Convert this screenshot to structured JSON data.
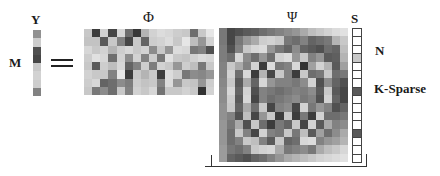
{
  "labels": {
    "y": "Y",
    "m": "M",
    "equals": "=",
    "phi": "Φ",
    "psi": "Ψ",
    "s": "S",
    "n": "N",
    "k_sparse": "K-Sparse"
  },
  "y_vector": [
    145,
    205,
    80,
    70,
    200,
    210,
    205,
    130
  ],
  "phi_matrix": {
    "rows": 8,
    "cols": 16,
    "values": [
      [
        200,
        60,
        210,
        70,
        215,
        110,
        55,
        180,
        210,
        220,
        215,
        205,
        200,
        110,
        200,
        230
      ],
      [
        195,
        195,
        90,
        200,
        130,
        70,
        200,
        100,
        205,
        210,
        220,
        200,
        230,
        190,
        150,
        210
      ],
      [
        215,
        200,
        210,
        180,
        205,
        215,
        200,
        210,
        140,
        200,
        150,
        220,
        215,
        120,
        130,
        80
      ],
      [
        205,
        225,
        215,
        110,
        210,
        140,
        210,
        130,
        205,
        120,
        225,
        200,
        195,
        210,
        220,
        215
      ],
      [
        200,
        90,
        205,
        190,
        215,
        100,
        130,
        205,
        125,
        210,
        200,
        150,
        205,
        190,
        120,
        200
      ],
      [
        210,
        200,
        200,
        130,
        230,
        60,
        200,
        180,
        200,
        60,
        220,
        205,
        120,
        140,
        135,
        150
      ],
      [
        205,
        215,
        100,
        110,
        140,
        125,
        205,
        195,
        200,
        130,
        220,
        150,
        200,
        195,
        150,
        205
      ],
      [
        200,
        120,
        140,
        110,
        200,
        130,
        210,
        200,
        215,
        115,
        200,
        200,
        210,
        200,
        50,
        210
      ]
    ]
  },
  "psi_matrix": {
    "rows": 16,
    "cols": 16,
    "values": [
      [
        120,
        70,
        80,
        90,
        95,
        110,
        120,
        130,
        140,
        150,
        170,
        190,
        200,
        210,
        220,
        225
      ],
      [
        120,
        70,
        120,
        150,
        170,
        205,
        210,
        200,
        120,
        110,
        130,
        100,
        110,
        120,
        180,
        200
      ],
      [
        125,
        80,
        130,
        200,
        215,
        220,
        150,
        120,
        100,
        140,
        100,
        90,
        80,
        110,
        100,
        190
      ],
      [
        125,
        110,
        215,
        140,
        110,
        150,
        110,
        210,
        220,
        150,
        200,
        130,
        150,
        90,
        95,
        180
      ],
      [
        130,
        200,
        170,
        130,
        210,
        60,
        220,
        120,
        130,
        215,
        50,
        160,
        210,
        180,
        90,
        160
      ],
      [
        130,
        210,
        110,
        215,
        60,
        180,
        70,
        200,
        130,
        60,
        200,
        110,
        120,
        200,
        110,
        120
      ],
      [
        135,
        200,
        90,
        170,
        100,
        215,
        150,
        130,
        130,
        120,
        140,
        210,
        80,
        140,
        100,
        80
      ],
      [
        140,
        215,
        100,
        210,
        80,
        130,
        120,
        110,
        120,
        130,
        125,
        140,
        90,
        200,
        90,
        70
      ],
      [
        140,
        205,
        90,
        215,
        70,
        130,
        110,
        120,
        130,
        140,
        120,
        130,
        80,
        210,
        100,
        70
      ],
      [
        145,
        200,
        100,
        170,
        110,
        200,
        70,
        130,
        140,
        70,
        210,
        120,
        150,
        130,
        80,
        100
      ],
      [
        145,
        130,
        80,
        190,
        70,
        150,
        200,
        60,
        200,
        60,
        120,
        60,
        210,
        110,
        110,
        120
      ],
      [
        150,
        120,
        170,
        80,
        200,
        110,
        60,
        120,
        100,
        200,
        70,
        210,
        90,
        170,
        130,
        140
      ],
      [
        150,
        110,
        200,
        130,
        70,
        210,
        130,
        120,
        200,
        120,
        190,
        90,
        160,
        110,
        140,
        170
      ],
      [
        150,
        110,
        130,
        200,
        190,
        130,
        90,
        200,
        100,
        110,
        215,
        220,
        130,
        150,
        160,
        180
      ],
      [
        155,
        120,
        110,
        130,
        200,
        210,
        215,
        170,
        120,
        130,
        140,
        120,
        170,
        190,
        200,
        215
      ],
      [
        155,
        100,
        90,
        80,
        100,
        110,
        130,
        150,
        170,
        180,
        190,
        200,
        210,
        215,
        220,
        225
      ]
    ]
  },
  "s_vector": [
    255,
    255,
    255,
    200,
    255,
    255,
    255,
    90,
    255,
    255,
    255,
    255,
    90,
    255,
    255,
    255
  ]
}
